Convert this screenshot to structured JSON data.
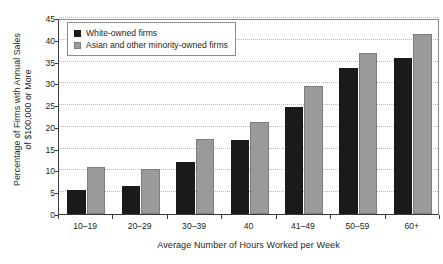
{
  "chart_data": {
    "type": "bar",
    "title": "",
    "subtitle": "",
    "xlabel": "Average Number of Hours Worked per Week",
    "ylabel": "Percentage of Firms with Annual Sales of $100,000 or More",
    "ylabel_lines": [
      "Percentage of Firms with Annual Sales",
      "of $100,000 or More"
    ],
    "categories": [
      "10–19",
      "20–29",
      "30–39",
      "40",
      "41–49",
      "50–59",
      "60+"
    ],
    "series": [
      {
        "name": "White-owned firms",
        "color": "#1a1a1a",
        "values": [
          5.6,
          6.4,
          12.0,
          17.1,
          24.5,
          33.5,
          35.9
        ]
      },
      {
        "name": "Asian and other minority-owned firms",
        "color": "#9a9a9a",
        "values": [
          10.7,
          10.4,
          17.2,
          21.2,
          29.4,
          37.0,
          41.4
        ]
      }
    ],
    "ylim": [
      0,
      45
    ],
    "ytick_values": [
      0,
      5,
      10,
      15,
      20,
      25,
      30,
      35,
      40,
      45
    ],
    "ytick_labels": [
      "0",
      "5",
      "10",
      "15",
      "20",
      "25",
      "30",
      "35",
      "40",
      "45"
    ],
    "grid": true,
    "grid_axis": "y",
    "legend_position": "top-left",
    "orientation": "vertical",
    "bar_group_mode": "grouped"
  }
}
